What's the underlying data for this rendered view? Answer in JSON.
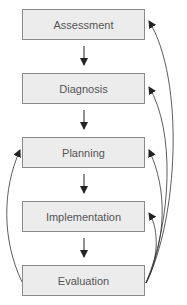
{
  "diagram": {
    "type": "flowchart",
    "steps": [
      {
        "label": "Assessment"
      },
      {
        "label": "Diagnosis"
      },
      {
        "label": "Planning"
      },
      {
        "label": "Implementation"
      },
      {
        "label": "Evaluation"
      }
    ],
    "edges": [
      {
        "from": "Assessment",
        "to": "Diagnosis",
        "kind": "straight"
      },
      {
        "from": "Diagnosis",
        "to": "Planning",
        "kind": "straight"
      },
      {
        "from": "Planning",
        "to": "Implementation",
        "kind": "straight"
      },
      {
        "from": "Implementation",
        "to": "Evaluation",
        "kind": "straight"
      },
      {
        "from": "Evaluation",
        "to": "Assessment",
        "kind": "feedback-curve-right"
      },
      {
        "from": "Evaluation",
        "to": "Diagnosis",
        "kind": "feedback-curve-right"
      },
      {
        "from": "Evaluation",
        "to": "Planning",
        "kind": "feedback-curve-right"
      },
      {
        "from": "Evaluation",
        "to": "Implementation",
        "kind": "feedback-curve-right"
      },
      {
        "from": "Evaluation",
        "to": "Planning",
        "kind": "feedback-curve-left"
      }
    ],
    "colors": {
      "box_fill": "#ececec",
      "box_border": "#8a8a8a",
      "text": "#555555",
      "arrow": "#222222"
    }
  }
}
